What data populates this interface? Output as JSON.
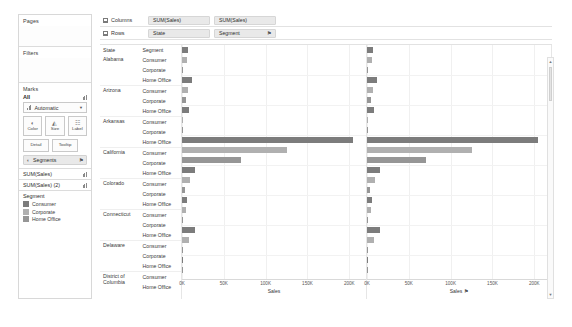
{
  "sidebar": {
    "pages": {
      "title": "Pages"
    },
    "filters": {
      "title": "Filters"
    },
    "marks": {
      "title": "Marks",
      "all_label": "All",
      "mark_type": "Automatic",
      "buttons": [
        {
          "name": "color",
          "label": "Color",
          "glyph": "◐"
        },
        {
          "name": "size",
          "label": "Size",
          "glyph": "◴"
        },
        {
          "name": "label",
          "label": "Label",
          "glyph": "☷"
        }
      ],
      "buttons2": [
        {
          "name": "detail",
          "label": "Detail"
        },
        {
          "name": "tooltip",
          "label": "Tooltip"
        }
      ],
      "encoding_pill": {
        "label": "Segments",
        "icon": "color-icon",
        "sort": "⚑"
      }
    },
    "measures": [
      {
        "label": "SUM(Sales)"
      },
      {
        "label": "SUM(Sales) (2)"
      }
    ],
    "legend": {
      "title": "Segment",
      "items": [
        {
          "label": "Consumer",
          "color": "#7c7c7c"
        },
        {
          "label": "Corporate",
          "color": "#b0b0b0"
        },
        {
          "label": "Home Office",
          "color": "#969696"
        }
      ]
    }
  },
  "shelves": {
    "columns": {
      "label": "Columns",
      "pills": [
        "SUM(Sales)",
        "SUM(Sales)"
      ]
    },
    "rows": {
      "label": "Rows",
      "pills": [
        "State",
        "Segment"
      ],
      "sort_icon": "⚑"
    }
  },
  "viz": {
    "header_columns": [
      "State",
      "Segment"
    ],
    "axis": {
      "ticks": [
        "0K",
        "50K",
        "100K",
        "150K",
        "200K"
      ],
      "tick_values": [
        0,
        50000,
        100000,
        150000,
        200000
      ],
      "max": 220000,
      "title": "Sales",
      "right_sort_icon": "⚑"
    }
  },
  "chart_data": {
    "type": "bar",
    "title": "",
    "xlabel": "Sales",
    "ylabel": "State / Segment",
    "xlim": [
      0,
      220000
    ],
    "ticks": [
      0,
      50000,
      100000,
      150000,
      200000
    ],
    "grid": true,
    "legend_position": "left-sidebar",
    "series_colors": {
      "Consumer": "#7c7c7c",
      "Corporate": "#b0b0b0",
      "Home Office": "#969696"
    },
    "panes": [
      "SUM(Sales)",
      "SUM(Sales)"
    ],
    "rows": [
      {
        "state": "Alabama",
        "segment": "Consumer",
        "value": 7000
      },
      {
        "state": "Alabama",
        "segment": "Corporate",
        "value": 5500
      },
      {
        "state": "Alabama",
        "segment": "Home Office",
        "value": 1500
      },
      {
        "state": "Arizona",
        "segment": "Consumer",
        "value": 12000
      },
      {
        "state": "Arizona",
        "segment": "Corporate",
        "value": 7500
      },
      {
        "state": "Arizona",
        "segment": "Home Office",
        "value": 5000
      },
      {
        "state": "Arkansas",
        "segment": "Consumer",
        "value": 8000
      },
      {
        "state": "Arkansas",
        "segment": "Corporate",
        "value": 1500
      },
      {
        "state": "Arkansas",
        "segment": "Home Office",
        "value": 1000
      },
      {
        "state": "California",
        "segment": "Consumer",
        "value": 205000
      },
      {
        "state": "California",
        "segment": "Corporate",
        "value": 125000
      },
      {
        "state": "California",
        "segment": "Home Office",
        "value": 70000
      },
      {
        "state": "Colorado",
        "segment": "Consumer",
        "value": 16000
      },
      {
        "state": "Colorado",
        "segment": "Corporate",
        "value": 9000
      },
      {
        "state": "Colorado",
        "segment": "Home Office",
        "value": 3000
      },
      {
        "state": "Connecticut",
        "segment": "Consumer",
        "value": 6000
      },
      {
        "state": "Connecticut",
        "segment": "Corporate",
        "value": 5000
      },
      {
        "state": "Connecticut",
        "segment": "Home Office",
        "value": 1500
      },
      {
        "state": "Delaware",
        "segment": "Consumer",
        "value": 15000
      },
      {
        "state": "Delaware",
        "segment": "Corporate",
        "value": 8000
      },
      {
        "state": "Delaware",
        "segment": "Home Office",
        "value": 1500
      },
      {
        "state": "District of Columbia",
        "segment": "Consumer",
        "value": 1500
      },
      {
        "state": "District of Columbia",
        "segment": "Home Office",
        "value": 1500
      }
    ]
  },
  "scrollbar": {
    "up": "▲",
    "down": "▼"
  }
}
